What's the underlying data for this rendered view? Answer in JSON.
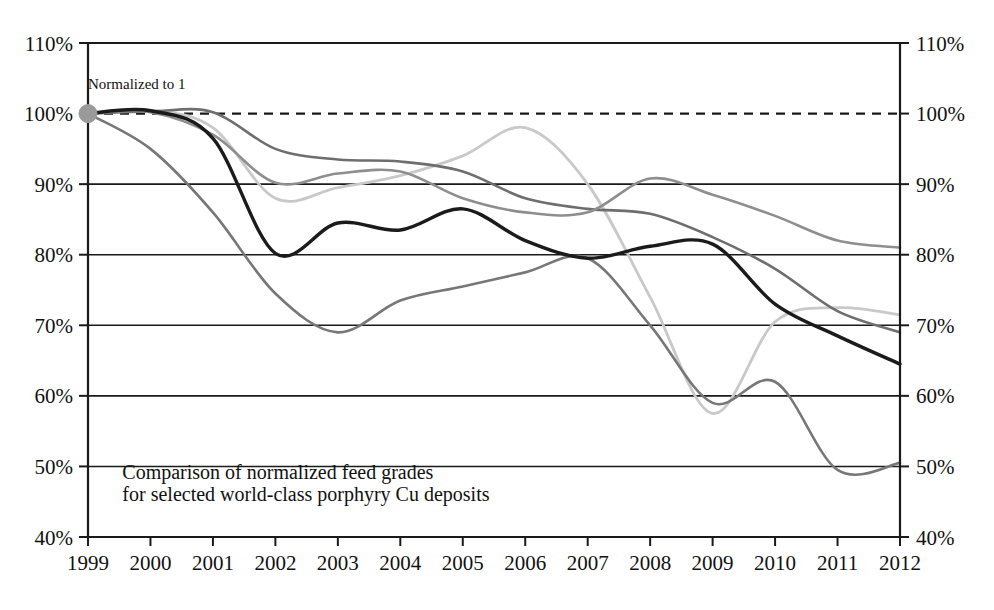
{
  "chart_data": {
    "type": "line",
    "title": "",
    "xlabel": "",
    "ylabel": "",
    "xlim": [
      1999,
      2012
    ],
    "ylim": [
      40,
      110
    ],
    "grid": true,
    "legend": false,
    "y_tick_format": "percent",
    "x": [
      1999,
      2000,
      2001,
      2002,
      2003,
      2004,
      2005,
      2006,
      2007,
      2008,
      2009,
      2010,
      2011,
      2012
    ],
    "y_ticks": [
      40,
      50,
      60,
      70,
      80,
      90,
      100,
      110
    ],
    "y_tick_labels_left": [
      "40%",
      "50%",
      "60%",
      "70%",
      "80%",
      "90%",
      "100%",
      "110%"
    ],
    "y_tick_labels_right": [
      "40%",
      "50%",
      "60%",
      "70%",
      "80%",
      "90%",
      "100%",
      "110%"
    ],
    "x_tick_labels": [
      "1999",
      "2000",
      "2001",
      "2002",
      "2003",
      "2004",
      "2005",
      "2006",
      "2007",
      "2008",
      "2009",
      "2010",
      "2011",
      "2012"
    ],
    "reference_line": {
      "name": "normalized-baseline",
      "value": 100,
      "style": "dashed",
      "color": "#1a1a1a"
    },
    "annotations": [
      {
        "name": "normalized-to-1-label",
        "text": "Normalized to 1",
        "x": 1999,
        "y": 103.5
      },
      {
        "name": "chart-caption-line-1",
        "text": "Comparison of normalized feed grades",
        "x": 1999.55,
        "y": 48.2
      },
      {
        "name": "chart-caption-line-2",
        "text": "for selected world-class porphyry Cu deposits",
        "x": 1999.55,
        "y": 45.1
      }
    ],
    "origin_marker": {
      "name": "normalized-origin-dot",
      "x": 1999,
      "y": 100,
      "color": "#9a9a9a"
    },
    "series": [
      {
        "name": "deposit-a-black",
        "color": "#1b1b1b",
        "width": 3.4,
        "values": [
          100,
          100.4,
          96.5,
          80.2,
          84.5,
          83.5,
          86.5,
          82.0,
          79.5,
          81.2,
          81.5,
          73.0,
          68.5,
          64.5
        ]
      },
      {
        "name": "deposit-b-dark-gray",
        "color": "#6e6e6e",
        "width": 2.6,
        "values": [
          100,
          100.3,
          100.2,
          95.0,
          93.5,
          93.2,
          91.8,
          88.0,
          86.5,
          85.8,
          82.5,
          78.0,
          72.0,
          69.0
        ]
      },
      {
        "name": "deposit-c-mid-gray",
        "color": "#8e8e8e",
        "width": 2.6,
        "values": [
          100,
          100.2,
          97.0,
          90.2,
          91.5,
          91.8,
          88.0,
          86.0,
          86.0,
          90.8,
          88.5,
          85.5,
          82.0,
          81.0
        ]
      },
      {
        "name": "deposit-d-light-gray",
        "color": "#c9c9c9",
        "width": 2.8,
        "values": [
          100,
          100.5,
          98.0,
          88.0,
          89.5,
          91.2,
          94.0,
          98.0,
          90.0,
          74.0,
          57.5,
          70.5,
          72.5,
          71.5
        ]
      },
      {
        "name": "deposit-e-medium-dark-gray",
        "color": "#777777",
        "width": 2.6,
        "values": [
          100,
          95.0,
          86.0,
          74.5,
          69.0,
          73.5,
          75.5,
          77.5,
          79.5,
          70.0,
          59.0,
          62.0,
          49.5,
          50.5
        ]
      }
    ]
  },
  "plot": {
    "axis_color": "#1a1a1a",
    "gridline_color": "#1a1a1a",
    "background": "#ffffff"
  }
}
